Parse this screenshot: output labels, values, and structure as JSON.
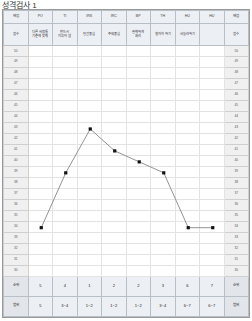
{
  "title": "성격검사 1",
  "table": {
    "corner_top_left": "배점",
    "corner_bottom_left": "점수",
    "corner_top_right": "배점",
    "corner_bottom_right": "점수",
    "footer_rank_label": "순위",
    "footer_range_label": "범위"
  },
  "columns": [
    {
      "code": "PO",
      "name": "다른 사람들\n기준에 맞춰",
      "rank": "5",
      "range": "5"
    },
    {
      "code": "TI",
      "name": "반드시\n이루어 냄",
      "rank": "4",
      "range": "3~4"
    },
    {
      "code": "IRS",
      "name": "인간중심",
      "rank": "1",
      "range": "1~2"
    },
    {
      "code": "IRC",
      "name": "주의중심",
      "rank": "2",
      "range": "1~2"
    },
    {
      "code": "BP",
      "name": "완벽하게\n처리",
      "rank": "2",
      "range": "1~2"
    },
    {
      "code": "TH",
      "name": "철저히 하기",
      "rank": "3",
      "range": "3~4"
    },
    {
      "code": "HU",
      "name": "서둘러하기",
      "rank": "6",
      "range": "6~7"
    },
    {
      "code": "HU2",
      "name": "",
      "rank": "7",
      "range": "6~7"
    }
  ],
  "scale": {
    "max": 50,
    "min": 30,
    "ticks": [
      50,
      49,
      48,
      47,
      46,
      45,
      44,
      43,
      42,
      41,
      40,
      39,
      38,
      37,
      36,
      35,
      34,
      33,
      32,
      31,
      30
    ]
  },
  "chart_data": {
    "type": "line",
    "title": "성격검사 1",
    "xlabel": "",
    "ylabel": "점수",
    "categories": [
      "PO",
      "TI",
      "IRS",
      "IRC",
      "BP",
      "TH",
      "HU",
      "HU2"
    ],
    "values": [
      34,
      39,
      43,
      41,
      40,
      39,
      34,
      34
    ],
    "ylim": [
      30,
      50
    ],
    "grid": true,
    "legend": "none",
    "marker": "square",
    "line_color": "#777777",
    "marker_color": "#111111"
  }
}
